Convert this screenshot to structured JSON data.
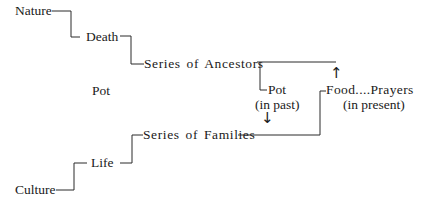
{
  "diagram": {
    "nodes": {
      "nature": "Nature",
      "death": "Death",
      "series_ancestors": "Series of Ancestors",
      "pot_center": "Pot",
      "pot_past": "Pot",
      "pot_past_note": "(in past)",
      "food_prayers": "Food....Prayers",
      "food_prayers_note": "(in present)",
      "series_families": "Series of Families",
      "life": "Life",
      "culture": "Culture"
    },
    "arrows": {
      "up": "↑",
      "down": "↓"
    },
    "edges": [
      {
        "from": "Nature",
        "to": "Death"
      },
      {
        "from": "Death",
        "to": "Series of Ancestors"
      },
      {
        "from": "Series of Ancestors",
        "to": "Pot (in past)"
      },
      {
        "from": "Series of Ancestors",
        "to": "Food....Prayers (in present)",
        "arrow": "up"
      },
      {
        "from": "Pot (in past)",
        "to": "Series of Families",
        "arrow": "down"
      },
      {
        "from": "Series of Families",
        "to": "Food....Prayers (in present)"
      },
      {
        "from": "Culture",
        "to": "Life"
      },
      {
        "from": "Life",
        "to": "Series of Families"
      }
    ]
  }
}
